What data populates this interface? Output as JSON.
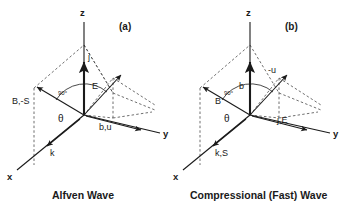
{
  "figure": {
    "title_visible": false,
    "background_color": "#ffffff",
    "line_color": "#1a1a1a",
    "dash_color": "#4a4a4a"
  },
  "panels": [
    {
      "id": "a",
      "panel_label": "(a)",
      "caption": "Alfven Wave",
      "axes": {
        "z": "z",
        "y": "y",
        "x": "x"
      },
      "angle_labels": {
        "perpendicular": "90°",
        "theta": "θ"
      },
      "vectors": [
        {
          "name": "current-density",
          "label": "j",
          "direction": "along +z"
        },
        {
          "name": "electric-field",
          "label": "E",
          "direction": "up-right in plane"
        },
        {
          "name": "background-field-poynting",
          "label": "B,-S",
          "direction": "up-left out of plane"
        },
        {
          "name": "wave-vector",
          "label": "k",
          "direction": "down-left along +x"
        },
        {
          "name": "perturbed-field-velocity",
          "label": "b,u",
          "direction": "along +y"
        }
      ]
    },
    {
      "id": "b",
      "panel_label": "(b)",
      "caption": "Compressional (Fast) Wave",
      "axes": {
        "z": "z",
        "y": "y",
        "x": "x"
      },
      "angle_labels": {
        "perpendicular": "90°",
        "theta": "θ"
      },
      "vectors": [
        {
          "name": "perturbed-field",
          "label": "b",
          "direction": "along +z"
        },
        {
          "name": "negative-velocity",
          "label": "-u",
          "direction": "up-right in plane"
        },
        {
          "name": "background-field",
          "label": "B",
          "direction": "up-left out of plane"
        },
        {
          "name": "wave-vector-poynting",
          "label": "k,S",
          "direction": "down-left along +x"
        },
        {
          "name": "current-electric-field",
          "label": "j,E",
          "direction": "along +y"
        }
      ]
    }
  ]
}
